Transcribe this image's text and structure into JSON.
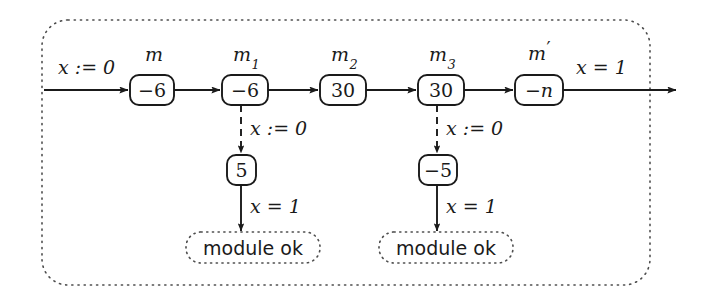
{
  "figure": {
    "type": "automaton-trace-diagram",
    "frame": {
      "style": "dotted-rounded-rectangle"
    },
    "colors": {
      "ink": "#1a1a1a",
      "background": "#ffffff",
      "dotted": "#555555"
    }
  },
  "main_chain": {
    "entry_label": "x := 0",
    "exit_label": "x = 1",
    "nodes": [
      {
        "name": "m",
        "name_base": "m",
        "name_sub": "",
        "name_prime": false,
        "value": "−6"
      },
      {
        "name": "m1",
        "name_base": "m",
        "name_sub": "1",
        "name_prime": false,
        "value": "−6"
      },
      {
        "name": "m2",
        "name_base": "m",
        "name_sub": "2",
        "name_prime": false,
        "value": "30"
      },
      {
        "name": "m3",
        "name_base": "m",
        "name_sub": "3",
        "name_prime": false,
        "value": "30"
      },
      {
        "name": "m'",
        "name_base": "m",
        "name_sub": "",
        "name_prime": true,
        "value": "−n"
      }
    ]
  },
  "branches": [
    {
      "id": "left",
      "from_node": "m1",
      "dashed_edge_label": "x := 0",
      "box_value": "5",
      "solid_edge_label": "x = 1",
      "terminal_text": "module ok"
    },
    {
      "id": "right",
      "from_node": "m3",
      "dashed_edge_label": "x := 0",
      "box_value": "−5",
      "solid_edge_label": "x = 1",
      "terminal_text": "module ok"
    }
  ]
}
